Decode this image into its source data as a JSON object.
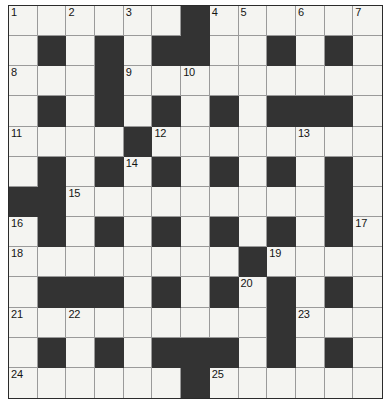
{
  "puzzle": {
    "title": "Crossword Grid",
    "rows": 13,
    "cols": 13,
    "colors": {
      "block": "#333333",
      "open": "#f4f4f1",
      "gridline": "#9a9a9a",
      "border": "#2b2b2b",
      "number_text": "#141414",
      "page_background": "#ffffff"
    },
    "grid": [
      [
        "0",
        "0",
        "0",
        "0",
        "0",
        "0",
        "1",
        "0",
        "0",
        "0",
        "0",
        "0",
        "0"
      ],
      [
        "0",
        "1",
        "0",
        "1",
        "0",
        "1",
        "1",
        "0",
        "0",
        "1",
        "0",
        "1",
        "0"
      ],
      [
        "0",
        "0",
        "0",
        "1",
        "0",
        "0",
        "0",
        "0",
        "0",
        "0",
        "0",
        "0",
        "0"
      ],
      [
        "0",
        "1",
        "0",
        "1",
        "0",
        "1",
        "0",
        "1",
        "0",
        "1",
        "1",
        "1",
        "0"
      ],
      [
        "0",
        "0",
        "0",
        "0",
        "1",
        "0",
        "0",
        "0",
        "0",
        "0",
        "0",
        "0",
        "0"
      ],
      [
        "0",
        "1",
        "0",
        "1",
        "0",
        "1",
        "0",
        "1",
        "0",
        "1",
        "0",
        "1",
        "0"
      ],
      [
        "1",
        "1",
        "0",
        "0",
        "0",
        "0",
        "0",
        "0",
        "0",
        "0",
        "0",
        "1",
        "0"
      ],
      [
        "0",
        "1",
        "0",
        "1",
        "0",
        "1",
        "0",
        "1",
        "0",
        "1",
        "0",
        "1",
        "0"
      ],
      [
        "0",
        "0",
        "0",
        "0",
        "0",
        "0",
        "0",
        "0",
        "1",
        "0",
        "0",
        "0",
        "0"
      ],
      [
        "0",
        "1",
        "1",
        "1",
        "0",
        "1",
        "0",
        "1",
        "0",
        "1",
        "0",
        "1",
        "0"
      ],
      [
        "0",
        "0",
        "0",
        "0",
        "0",
        "0",
        "0",
        "0",
        "0",
        "1",
        "0",
        "0",
        "0"
      ],
      [
        "0",
        "1",
        "0",
        "1",
        "0",
        "1",
        "1",
        "1",
        "0",
        "1",
        "0",
        "1",
        "0"
      ],
      [
        "0",
        "0",
        "0",
        "0",
        "0",
        "0",
        "1",
        "0",
        "0",
        "0",
        "0",
        "0",
        "0"
      ]
    ],
    "numbers": [
      {
        "row": 0,
        "col": 0,
        "label": "1"
      },
      {
        "row": 0,
        "col": 2,
        "label": "2"
      },
      {
        "row": 0,
        "col": 4,
        "label": "3"
      },
      {
        "row": 0,
        "col": 7,
        "label": "4"
      },
      {
        "row": 0,
        "col": 8,
        "label": "5"
      },
      {
        "row": 0,
        "col": 10,
        "label": "6"
      },
      {
        "row": 0,
        "col": 12,
        "label": "7"
      },
      {
        "row": 2,
        "col": 0,
        "label": "8"
      },
      {
        "row": 2,
        "col": 4,
        "label": "9"
      },
      {
        "row": 2,
        "col": 6,
        "label": "10"
      },
      {
        "row": 4,
        "col": 0,
        "label": "11"
      },
      {
        "row": 4,
        "col": 5,
        "label": "12"
      },
      {
        "row": 4,
        "col": 10,
        "label": "13"
      },
      {
        "row": 5,
        "col": 4,
        "label": "14"
      },
      {
        "row": 6,
        "col": 2,
        "label": "15"
      },
      {
        "row": 7,
        "col": 0,
        "label": "16"
      },
      {
        "row": 7,
        "col": 12,
        "label": "17"
      },
      {
        "row": 8,
        "col": 0,
        "label": "18"
      },
      {
        "row": 8,
        "col": 9,
        "label": "19"
      },
      {
        "row": 9,
        "col": 8,
        "label": "20"
      },
      {
        "row": 10,
        "col": 0,
        "label": "21"
      },
      {
        "row": 10,
        "col": 2,
        "label": "22"
      },
      {
        "row": 10,
        "col": 10,
        "label": "23"
      },
      {
        "row": 12,
        "col": 0,
        "label": "24"
      },
      {
        "row": 12,
        "col": 7,
        "label": "25"
      }
    ]
  }
}
